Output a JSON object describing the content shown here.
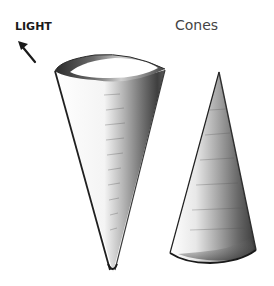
{
  "labels": {
    "light": "LIGHT",
    "title": "Cones"
  },
  "icons": {
    "light_direction": "arrow-up-left-icon"
  },
  "figures": [
    {
      "name": "inverted-cone",
      "description": "Large cone, point down, open top ellipse"
    },
    {
      "name": "upright-cone",
      "description": "Smaller cone, point up"
    }
  ],
  "colors": {
    "background": "#ffffff",
    "ink": "#1a1a1a",
    "shadow": "#3a3a3a",
    "midtone": "#8a8a8a"
  }
}
